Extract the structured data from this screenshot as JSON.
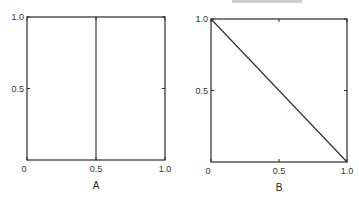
{
  "chart_data": [
    {
      "type": "line",
      "panel_label": "A",
      "xlim": [
        0,
        1.0
      ],
      "ylim": [
        0,
        1.0
      ],
      "x_ticks": [
        "0",
        "0.5",
        "1.0"
      ],
      "y_ticks": [
        "0.5",
        "1.0"
      ],
      "series": [
        {
          "name": "vertical line",
          "x": [
            0.5,
            0.5
          ],
          "y": [
            0,
            1.0
          ]
        }
      ],
      "grid": false
    },
    {
      "type": "line",
      "panel_label": "B",
      "xlim": [
        0,
        1.0
      ],
      "ylim": [
        0,
        1.0
      ],
      "x_ticks": [
        "0",
        "0.5",
        "1.0"
      ],
      "y_ticks": [
        "0.5",
        "1.0"
      ],
      "series": [
        {
          "name": "diagonal line",
          "x": [
            0,
            1.0
          ],
          "y": [
            1.0,
            0
          ]
        }
      ],
      "grid": false
    }
  ]
}
